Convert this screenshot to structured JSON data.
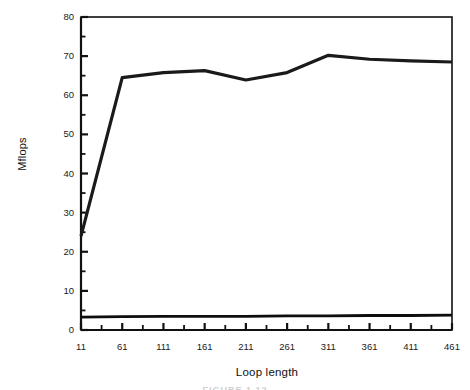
{
  "chart_data": {
    "type": "line",
    "title": "",
    "xlabel": "Loop length",
    "ylabel": "Mflops",
    "xlim": [
      11,
      461
    ],
    "ylim": [
      0,
      80
    ],
    "grid": false,
    "legend": "none",
    "x_ticks": [
      11,
      61,
      111,
      161,
      211,
      261,
      311,
      361,
      411,
      461
    ],
    "x_tick_labels": [
      "11",
      "61",
      "111",
      "161",
      "211",
      "261",
      "311",
      "361",
      "411",
      "461"
    ],
    "x_minor_tick_step": 25,
    "y_ticks": [
      0,
      10,
      20,
      30,
      40,
      50,
      60,
      70,
      80
    ],
    "y_tick_labels": [
      "0",
      "10",
      "20",
      "30",
      "40",
      "50",
      "60",
      "70",
      "80"
    ],
    "y_minor_tick_step": 5,
    "x": [
      11,
      61,
      111,
      161,
      211,
      261,
      311,
      361,
      411,
      461
    ],
    "series": [
      {
        "name": "upper-curve",
        "color": "#1a1a1a",
        "line_width": 3.2,
        "values": [
          24.0,
          64.5,
          65.8,
          66.3,
          63.9,
          65.8,
          70.2,
          69.2,
          68.8,
          68.5
        ]
      },
      {
        "name": "lower-curve",
        "color": "#0d0d0d",
        "line_width": 2.8,
        "values": [
          3.3,
          3.4,
          3.5,
          3.5,
          3.5,
          3.6,
          3.6,
          3.7,
          3.7,
          3.8
        ]
      }
    ]
  },
  "caption": {
    "remnant_text": "FIGURE 1.12"
  },
  "colors": {
    "axis": "#111111",
    "background": "#ffffff",
    "data": "#1a1a1a"
  }
}
